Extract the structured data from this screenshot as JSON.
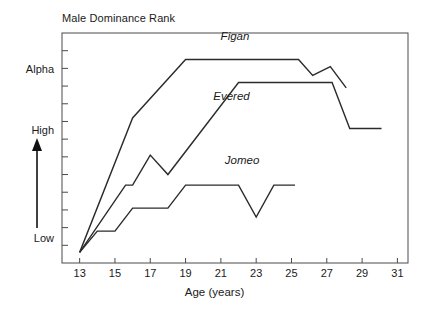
{
  "chart_data": {
    "type": "line",
    "title": "Male Dominance Rank",
    "xlabel": "Age (years)",
    "ylabel": "",
    "xlim": [
      12,
      31.6
    ],
    "ylim": [
      0,
      13
    ],
    "grid": false,
    "legend_position": "inline-labels",
    "xticks": [
      "13",
      "15",
      "17",
      "19",
      "21",
      "23",
      "25",
      "27",
      "29",
      "31"
    ],
    "xtick_values": [
      13,
      15,
      17,
      19,
      21,
      23,
      25,
      27,
      29,
      31
    ],
    "ytick_labels": [
      "Alpha",
      "High",
      "Low"
    ],
    "ytick_label_values": [
      11.5,
      7.5,
      1.8
    ],
    "y_axis_annotation": {
      "arrow": "upward-arrow",
      "arrow_from": "Low",
      "arrow_to": "High"
    },
    "series": [
      {
        "name": "Figan",
        "label_x": 21.8,
        "label_y": 12.6,
        "x": [
          13,
          16,
          19,
          25.4,
          26.2,
          27.2,
          28.1
        ],
        "y": [
          0.6,
          8.2,
          11.5,
          11.5,
          10.6,
          11.1,
          9.9
        ]
      },
      {
        "name": "Evered",
        "label_x": 21.6,
        "label_y": 9.2,
        "x": [
          13,
          15.6,
          16,
          17,
          18,
          22,
          27.3,
          28.3,
          30.1
        ],
        "y": [
          0.6,
          4.4,
          4.4,
          6.1,
          5.0,
          10.2,
          10.2,
          7.6,
          7.6
        ]
      },
      {
        "name": "Jomeo",
        "label_x": 22.2,
        "label_y": 5.6,
        "x": [
          13,
          14,
          15,
          16,
          18,
          19,
          22,
          23,
          24,
          25.2
        ],
        "y": [
          0.6,
          1.8,
          1.8,
          3.1,
          3.1,
          4.4,
          4.4,
          2.6,
          4.4,
          4.4
        ]
      }
    ]
  }
}
